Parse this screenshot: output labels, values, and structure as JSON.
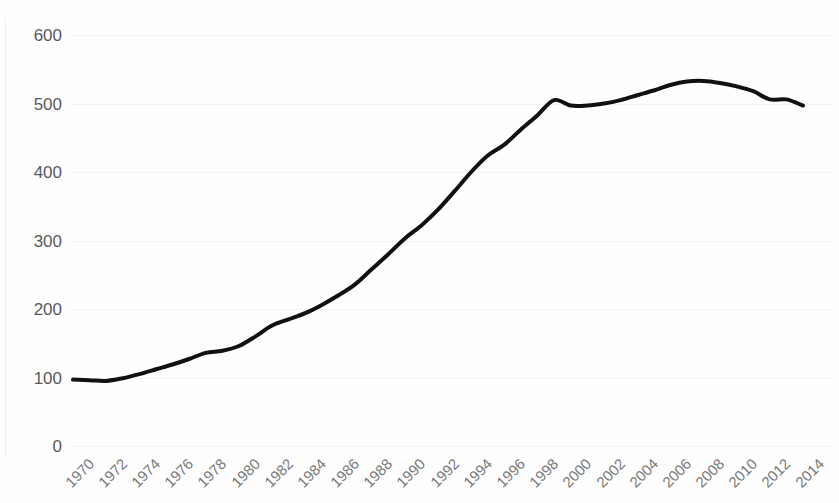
{
  "chart_data": {
    "type": "line",
    "title": "",
    "subtitle": "",
    "xlabel": "",
    "ylabel": "",
    "grid": true,
    "legend": false,
    "legend_position": "none",
    "line_color": "#111111",
    "line_width": 4,
    "background_color": "#fefefe",
    "gridline_color": "#f4f4f4",
    "axis_label_color": "#595959",
    "xtick_label_color": "#7a7a7a",
    "xlim": [
      1970,
      2014
    ],
    "ylim": [
      0,
      600
    ],
    "yticks": [
      0,
      100,
      200,
      300,
      400,
      500,
      600
    ],
    "ytick_labels": [
      "0",
      "100",
      "200",
      "300",
      "400",
      "500",
      "600"
    ],
    "xticks": [
      1970,
      1972,
      1974,
      1976,
      1978,
      1980,
      1982,
      1984,
      1986,
      1988,
      1990,
      1992,
      1994,
      1996,
      1998,
      2000,
      2002,
      2004,
      2006,
      2008,
      2010,
      2012,
      2014
    ],
    "xtick_labels": [
      "1970",
      "1972",
      "1974",
      "1976",
      "1978",
      "1980",
      "1982",
      "1984",
      "1986",
      "1988",
      "1990",
      "1992",
      "1994",
      "1996",
      "1998",
      "2000",
      "2002",
      "2004",
      "2006",
      "2008",
      "2010",
      "2012",
      "2014"
    ],
    "xtick_rotation": -45,
    "x": [
      1970,
      1971,
      1972,
      1973,
      1974,
      1975,
      1976,
      1977,
      1978,
      1979,
      1980,
      1981,
      1982,
      1983,
      1984,
      1985,
      1986,
      1987,
      1988,
      1989,
      1990,
      1991,
      1992,
      1993,
      1994,
      1995,
      1996,
      1997,
      1998,
      1999,
      2000,
      2001,
      2002,
      2003,
      2004,
      2005,
      2006,
      2007,
      2008,
      2009,
      2010,
      2011,
      2012,
      2013,
      2014
    ],
    "values": [
      97,
      96,
      95,
      99,
      105,
      112,
      119,
      127,
      136,
      139,
      146,
      160,
      176,
      185,
      194,
      206,
      220,
      236,
      258,
      280,
      303,
      322,
      345,
      372,
      400,
      424,
      440,
      462,
      483,
      505,
      497,
      497,
      500,
      505,
      512,
      519,
      527,
      532,
      533,
      530,
      525,
      518,
      506,
      506,
      497
    ]
  }
}
